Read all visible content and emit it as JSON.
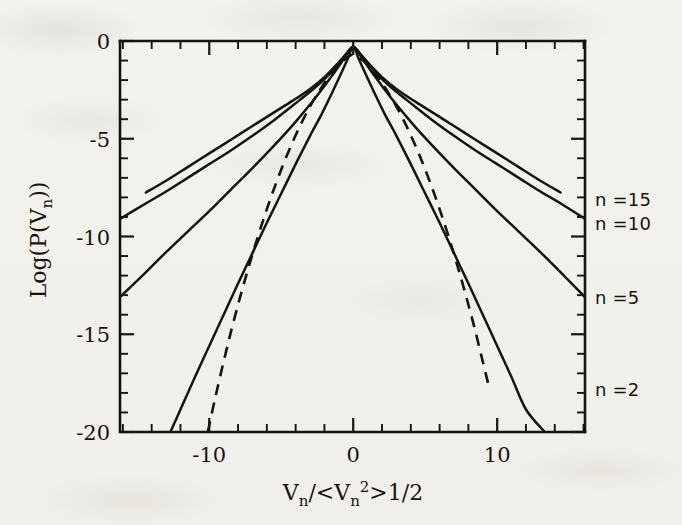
{
  "figure": {
    "background_color": "#f4f2ee",
    "ink_color": "#16140f",
    "x_axis_title_parts": {
      "v": "V",
      "n1": "n",
      "slash": "/<",
      "v2": "V",
      "n2": "n",
      "exp2": "2",
      "gt": ">",
      "half": "1/2"
    },
    "y_axis_title_parts": {
      "log_open": "Log(P(V",
      "n": "n",
      "close": "))"
    }
  },
  "chart_data": {
    "type": "line",
    "title": "",
    "subtitle": "",
    "xlabel": "V_n/<V_n^2>1/2",
    "ylabel": "Log(P(V_n))",
    "xlim": [
      -16.2,
      16.1
    ],
    "ylim": [
      -20,
      0
    ],
    "xticks": [
      -10,
      0,
      10
    ],
    "xticklabels": [
      "-10",
      "0",
      "10"
    ],
    "yticks": [
      0,
      -5,
      -10,
      -15,
      -20
    ],
    "yticklabels": [
      "0",
      "-5",
      "-10",
      "-15",
      "-20"
    ],
    "x_minor_tick_interval": 2,
    "y_minor_tick_interval": 1,
    "grid": false,
    "legend_position": "right-outside",
    "annotations": [
      {
        "text": "n =15",
        "x": 16.6,
        "y": -8.1
      },
      {
        "text": "n =10",
        "x": 16.6,
        "y": -9.3
      },
      {
        "text": "n =5",
        "x": 16.6,
        "y": -13.1
      },
      {
        "text": "n =2",
        "x": 16.6,
        "y": -17.8
      }
    ],
    "series": [
      {
        "name": "n = 15",
        "style": "solid",
        "label": "n =15",
        "x": [
          -14.4,
          -13.0,
          -11.5,
          -10.0,
          -8.5,
          -7.0,
          -5.5,
          -4.2,
          -3.0,
          -2.0,
          -1.2,
          -0.6,
          -0.2,
          0.0,
          0.2,
          0.6,
          1.2,
          2.0,
          3.0,
          4.2,
          5.5,
          7.0,
          8.5,
          10.0,
          11.5,
          13.0,
          14.4
        ],
        "y": [
          -7.75,
          -7.15,
          -6.45,
          -5.75,
          -5.05,
          -4.35,
          -3.65,
          -3.05,
          -2.45,
          -1.85,
          -1.25,
          -0.75,
          -0.4,
          -0.3,
          -0.4,
          -0.75,
          -1.25,
          -1.85,
          -2.45,
          -3.05,
          -3.65,
          -4.35,
          -5.05,
          -5.75,
          -6.45,
          -7.15,
          -7.75
        ]
      },
      {
        "name": "n = 10",
        "style": "solid",
        "label": "n =10",
        "x": [
          -16.2,
          -14.5,
          -13.0,
          -11.5,
          -10.0,
          -8.5,
          -7.0,
          -5.5,
          -4.2,
          -3.0,
          -2.0,
          -1.2,
          -0.6,
          -0.2,
          0.0,
          0.2,
          0.6,
          1.2,
          2.0,
          3.0,
          4.2,
          5.5,
          7.0,
          8.5,
          10.0,
          11.5,
          13.0,
          14.5,
          16.1
        ],
        "y": [
          -9.1,
          -8.35,
          -7.7,
          -7.0,
          -6.3,
          -5.6,
          -4.85,
          -4.05,
          -3.3,
          -2.6,
          -1.95,
          -1.3,
          -0.78,
          -0.4,
          -0.3,
          -0.4,
          -0.78,
          -1.3,
          -1.95,
          -2.6,
          -3.3,
          -4.05,
          -4.85,
          -5.6,
          -6.3,
          -7.0,
          -7.7,
          -8.35,
          -9.1
        ]
      },
      {
        "name": "n = 5",
        "style": "solid",
        "label": "n =5",
        "x": [
          -16.2,
          -14.5,
          -13.0,
          -11.5,
          -10.0,
          -8.5,
          -7.0,
          -5.5,
          -4.2,
          -3.0,
          -2.0,
          -1.2,
          -0.6,
          -0.2,
          0.0,
          0.2,
          0.6,
          1.2,
          2.0,
          3.0,
          4.2,
          5.5,
          7.0,
          8.5,
          10.0,
          11.5,
          13.0,
          14.5,
          16.1
        ],
        "y": [
          -13.1,
          -11.9,
          -10.8,
          -9.75,
          -8.7,
          -7.6,
          -6.5,
          -5.35,
          -4.3,
          -3.25,
          -2.3,
          -1.5,
          -0.85,
          -0.42,
          -0.3,
          -0.42,
          -0.85,
          -1.5,
          -2.3,
          -3.25,
          -4.3,
          -5.35,
          -6.5,
          -7.6,
          -8.7,
          -9.75,
          -10.8,
          -11.9,
          -13.1
        ]
      },
      {
        "name": "n = 2",
        "style": "solid",
        "label": "n =2",
        "x": [
          -12.7,
          -12.0,
          -11.0,
          -10.0,
          -9.0,
          -8.0,
          -7.0,
          -6.0,
          -5.0,
          -4.0,
          -3.0,
          -2.2,
          -1.5,
          -0.9,
          -0.4,
          0.0,
          0.4,
          0.9,
          1.5,
          2.2,
          3.0,
          4.0,
          5.0,
          6.0,
          7.0,
          8.0,
          9.0,
          10.0,
          11.0,
          12.0,
          13.3
        ],
        "y": [
          -20.0,
          -18.85,
          -17.2,
          -15.6,
          -14.0,
          -12.4,
          -10.85,
          -9.3,
          -7.8,
          -6.3,
          -4.85,
          -3.75,
          -2.7,
          -1.75,
          -0.95,
          -0.3,
          -0.95,
          -1.75,
          -2.7,
          -3.75,
          -4.85,
          -6.3,
          -7.8,
          -9.3,
          -10.85,
          -12.4,
          -14.0,
          -15.6,
          -17.2,
          -18.85,
          -20.0
        ]
      },
      {
        "name": "Gaussian",
        "style": "dashed",
        "label": "",
        "x": [
          -10.1,
          -9.6,
          -9.0,
          -8.4,
          -7.8,
          -7.2,
          -6.6,
          -6.0,
          -5.4,
          -4.8,
          -4.2,
          -3.6,
          -3.0,
          -2.4,
          -1.8,
          -1.2,
          -0.6,
          0.0,
          0.6,
          1.2,
          1.8,
          2.4,
          3.0,
          3.6,
          4.2,
          4.8,
          5.4,
          6.0,
          6.6,
          7.2,
          7.8,
          8.4,
          9.0,
          9.4
        ],
        "y": [
          -20.0,
          -18.3,
          -16.4,
          -14.6,
          -12.95,
          -11.4,
          -9.95,
          -8.6,
          -7.35,
          -6.2,
          -5.15,
          -4.2,
          -3.35,
          -2.6,
          -1.95,
          -1.4,
          -0.95,
          -0.7,
          -0.95,
          -1.4,
          -1.95,
          -2.6,
          -3.35,
          -4.2,
          -5.15,
          -6.2,
          -7.35,
          -8.6,
          -9.95,
          -11.4,
          -12.95,
          -14.6,
          -16.4,
          -17.6
        ]
      }
    ]
  },
  "axis_tick_labels": {
    "y": [
      "0",
      "-5",
      "-10",
      "-15",
      "-20"
    ],
    "x": [
      "-10",
      "0",
      "10"
    ]
  },
  "series_labels": [
    "n =15",
    "n =10",
    "n =5",
    "n =2"
  ]
}
